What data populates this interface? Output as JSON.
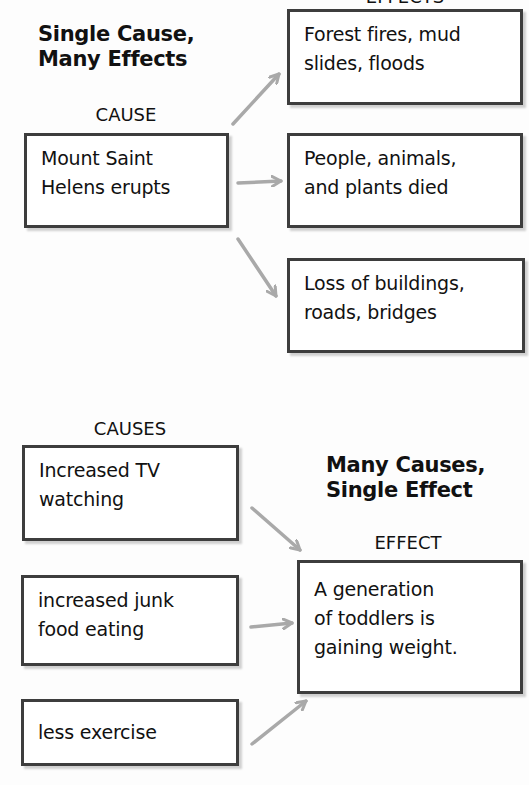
{
  "top_section": {
    "effects_label": "EFFECTS",
    "title_line1": "Single Cause,",
    "title_line2": "Many Effects",
    "cause_label": "CAUSE",
    "cause": "Mount Saint\nHelens erupts",
    "effects": [
      "Forest fires, mud\nslides, floods",
      "People, animals,\nand plants died",
      "Loss of buildings,\nroads, bridges"
    ]
  },
  "bottom_section": {
    "causes_label": "CAUSES",
    "title_line1": "Many Causes,",
    "title_line2": "Single Effect",
    "effect_label": "EFFECT",
    "causes": [
      "Increased TV\nwatching",
      "increased junk\nfood eating",
      "less exercise"
    ],
    "effect": "A generation\nof toddlers is\ngaining weight."
  },
  "colors": {
    "box_border": "#3d3d3d",
    "arrow": "#a9a9a9",
    "background": "#fdfdfd"
  }
}
